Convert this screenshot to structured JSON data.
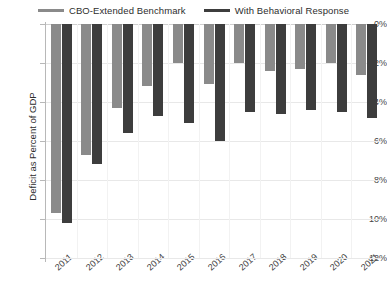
{
  "legend": {
    "items": [
      {
        "label": "CBO-Extended Benchmark",
        "color": "#8a8a8a",
        "key": "benchmark"
      },
      {
        "label": "With Behavioral Response",
        "color": "#3d3d3d",
        "key": "behavioral"
      }
    ]
  },
  "axes": {
    "y_title": "Deficit as Percent of GDP",
    "y_ticks": [
      "0%",
      "-2%",
      "-4%",
      "-6%",
      "-8%",
      "-10%",
      "-12%"
    ],
    "x_ticks": [
      "2011",
      "2012",
      "2013",
      "2014",
      "2015",
      "2016",
      "2017",
      "2018",
      "2019",
      "2020",
      "2021"
    ]
  },
  "chart_data": {
    "type": "bar",
    "title": "",
    "subtitle": "",
    "xlabel": "",
    "ylabel": "Deficit as Percent of GDP",
    "categories": [
      "2011",
      "2012",
      "2013",
      "2014",
      "2015",
      "2016",
      "2017",
      "2018",
      "2019",
      "2020",
      "2021"
    ],
    "series": [
      {
        "name": "CBO-Extended Benchmark",
        "color": "#8a8a8a",
        "values": [
          -9.7,
          -6.7,
          -4.3,
          -3.2,
          -2.0,
          -3.1,
          -2.0,
          -2.4,
          -2.3,
          -2.0,
          -2.6
        ]
      },
      {
        "name": "With Behavioral Response",
        "color": "#3d3d3d",
        "values": [
          -10.2,
          -7.2,
          -5.6,
          -4.7,
          -5.1,
          -6.0,
          -4.5,
          -4.6,
          -4.4,
          -4.5,
          -4.8
        ]
      }
    ],
    "ylim": [
      -12,
      0
    ],
    "ytick_values": [
      0,
      -2,
      -4,
      -6,
      -8,
      -10,
      -12
    ],
    "grid": true,
    "legend_position": "top"
  }
}
